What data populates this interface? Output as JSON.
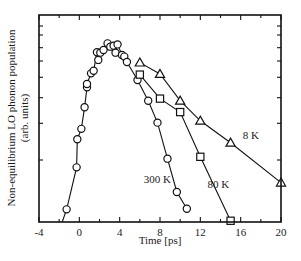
{
  "chart_data": {
    "type": "line",
    "title": "",
    "xlabel": "Time [ps]",
    "ylabel": "Non-equilibrium LO phonon population",
    "ylabel_units": "(arb. units)",
    "xlim": [
      -4,
      20
    ],
    "ylim": [
      0,
      1
    ],
    "x_ticks": [
      -4,
      0,
      4,
      8,
      12,
      16,
      20
    ],
    "x_tick_labels": [
      "-4",
      "0",
      "4",
      "8",
      "12",
      "16",
      "20"
    ],
    "y_ticks_unlabeled": true,
    "grid": false,
    "legend": "inline labels",
    "series": [
      {
        "name": "300K",
        "label": "300 K",
        "marker": "circle",
        "points": [
          [
            -1.26,
            0.061
          ],
          [
            -0.27,
            0.264
          ],
          [
            -0.2,
            0.4
          ],
          [
            0.2,
            0.45
          ],
          [
            0.52,
            0.554
          ],
          [
            0.76,
            0.651
          ],
          [
            0.76,
            0.667
          ],
          [
            1.16,
            0.718
          ],
          [
            1.42,
            0.731
          ],
          [
            1.75,
            0.82
          ],
          [
            1.88,
            0.783
          ],
          [
            2.08,
            0.818
          ],
          [
            2.4,
            0.831
          ],
          [
            2.8,
            0.863
          ],
          [
            3.07,
            0.847
          ],
          [
            3.4,
            0.852
          ],
          [
            3.59,
            0.818
          ],
          [
            3.79,
            0.858
          ],
          [
            4.23,
            0.807
          ],
          [
            4.46,
            0.799
          ],
          [
            4.72,
            0.773
          ],
          [
            5.77,
            0.686
          ],
          [
            6.83,
            0.586
          ],
          [
            7.75,
            0.48
          ],
          [
            8.74,
            0.306
          ],
          [
            9.67,
            0.145
          ],
          [
            10.66,
            0.064
          ]
        ],
        "line_from": [
          -1.7,
          0.0
        ]
      },
      {
        "name": "80K",
        "label": "80 K",
        "marker": "square",
        "points": [
          [
            6,
            0.712
          ],
          [
            8,
            0.596
          ],
          [
            10,
            0.531
          ],
          [
            12,
            0.315
          ],
          [
            15,
            0.006
          ]
        ]
      },
      {
        "name": "8K",
        "label": "8 K",
        "marker": "triangle",
        "points": [
          [
            6,
            0.77
          ],
          [
            8,
            0.715
          ],
          [
            10,
            0.586
          ],
          [
            12,
            0.489
          ],
          [
            15,
            0.383
          ],
          [
            20,
            0.19
          ]
        ]
      }
    ],
    "annotations": [
      {
        "text": "300 K",
        "x": 6.4,
        "y": 0.19
      },
      {
        "text": "80 K",
        "x": 12.7,
        "y": 0.165
      },
      {
        "text": "8 K",
        "x": 16.2,
        "y": 0.4
      }
    ]
  },
  "plot_box": {
    "left": 39,
    "top": 15,
    "right": 281,
    "bottom": 222
  },
  "y_tick_pixels": [
    26,
    35,
    47.7,
    61,
    77.3,
    97.7,
    123.3,
    160
  ]
}
